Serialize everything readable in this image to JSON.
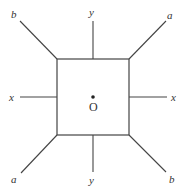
{
  "diagram": {
    "colors": {
      "stroke": "#444444",
      "text": "#333333",
      "background": "#ffffff"
    },
    "square": {
      "x": 57,
      "y": 59,
      "width": 72,
      "height": 76
    },
    "center": {
      "x": 93,
      "y": 97,
      "label": "O"
    },
    "lines": [
      {
        "id": "b-top-left",
        "x1": 20,
        "y1": 21,
        "x2": 57,
        "y2": 59,
        "label": "b",
        "lx": 14,
        "ly": 18
      },
      {
        "id": "y-top",
        "x1": 93,
        "y1": 21,
        "x2": 93,
        "y2": 59,
        "label": "y",
        "lx": 92,
        "ly": 16
      },
      {
        "id": "a-top-right",
        "x1": 166,
        "y1": 21,
        "x2": 129,
        "y2": 59,
        "label": "a",
        "lx": 171,
        "ly": 18
      },
      {
        "id": "x-left",
        "x1": 20,
        "y1": 97,
        "x2": 57,
        "y2": 97,
        "label": "x",
        "lx": 12,
        "ly": 100
      },
      {
        "id": "x-right",
        "x1": 129,
        "y1": 97,
        "x2": 167,
        "y2": 97,
        "label": "x",
        "lx": 174,
        "ly": 100
      },
      {
        "id": "a-bottom-left",
        "x1": 21,
        "y1": 173,
        "x2": 57,
        "y2": 135,
        "label": "a",
        "lx": 14,
        "ly": 181
      },
      {
        "id": "y-bottom",
        "x1": 93,
        "y1": 135,
        "x2": 93,
        "y2": 172,
        "label": "y",
        "lx": 92,
        "ly": 183
      },
      {
        "id": "b-bottom-right",
        "x1": 129,
        "y1": 135,
        "x2": 166,
        "y2": 172,
        "label": "b",
        "lx": 172,
        "ly": 181
      }
    ],
    "labels": {
      "b_top_left": "b",
      "y_top": "y",
      "a_top_right": "a",
      "x_left": "x",
      "x_right": "x",
      "a_bottom_left": "a",
      "y_bottom": "y",
      "b_bottom_right": "b",
      "center": "O"
    }
  }
}
